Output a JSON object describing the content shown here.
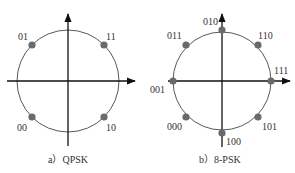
{
  "diagrams": [
    {
      "id": "qpsk",
      "caption": "a）QPSK",
      "center": [
        68,
        81
      ],
      "radius": 51,
      "points": [
        {
          "label": "01",
          "x": 32,
          "y": 45,
          "lx": 18,
          "ly": 40
        },
        {
          "label": "11",
          "x": 104,
          "y": 45,
          "lx": 106,
          "ly": 40
        },
        {
          "label": "00",
          "x": 32,
          "y": 117,
          "lx": 17,
          "ly": 131
        },
        {
          "label": "10",
          "x": 104,
          "y": 117,
          "lx": 106,
          "ly": 131
        }
      ]
    },
    {
      "id": "8psk",
      "caption": "b）8-PSK",
      "center": [
        222,
        81
      ],
      "radius": 49,
      "points": [
        {
          "label": "010",
          "x": 222,
          "y": 30,
          "lx": 203,
          "ly": 25
        },
        {
          "label": "011",
          "x": 186,
          "y": 45,
          "lx": 167,
          "ly": 39
        },
        {
          "label": "110",
          "x": 258,
          "y": 45,
          "lx": 258,
          "ly": 39
        },
        {
          "label": "001",
          "x": 173,
          "y": 81,
          "lx": 150,
          "ly": 93
        },
        {
          "label": "111",
          "x": 271,
          "y": 81,
          "lx": 274,
          "ly": 74
        },
        {
          "label": "000",
          "x": 186,
          "y": 117,
          "lx": 167,
          "ly": 130
        },
        {
          "label": "101",
          "x": 258,
          "y": 117,
          "lx": 262,
          "ly": 130
        },
        {
          "label": "100",
          "x": 222,
          "y": 133,
          "lx": 226,
          "ly": 145
        }
      ]
    }
  ]
}
